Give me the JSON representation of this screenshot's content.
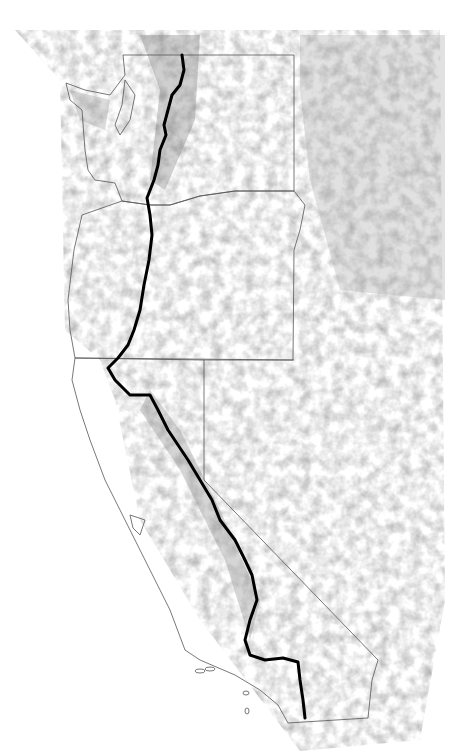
{
  "map": {
    "subject": "Pacific Crest Trail route",
    "regions": [
      "Washington",
      "Oregon",
      "California"
    ],
    "colors": {
      "background": "#ffffff",
      "border": "#555555",
      "trail": "#000000",
      "terrain_dark": "#8a8a8a",
      "terrain_light": "#d9d9d9"
    }
  }
}
